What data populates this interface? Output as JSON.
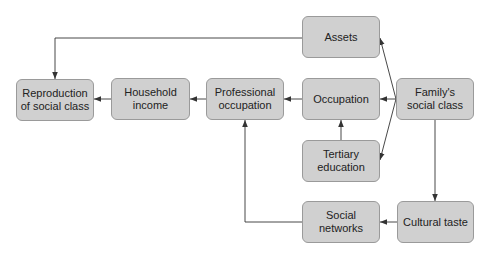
{
  "diagram": {
    "type": "flowchart",
    "colors": {
      "node_fill": "#d0d0d0",
      "node_border": "#9a9a9a",
      "text": "#222222",
      "edge": "#333333"
    },
    "nodes": {
      "reproduction": {
        "label": "Reproduction of social class",
        "x": 16,
        "y": 79,
        "w": 78,
        "h": 42
      },
      "household": {
        "label": "Household income",
        "x": 111,
        "y": 78,
        "w": 79,
        "h": 42
      },
      "professional": {
        "label": "Professional occupation",
        "x": 206,
        "y": 78,
        "w": 78,
        "h": 42
      },
      "assets": {
        "label": "Assets",
        "x": 302,
        "y": 16,
        "w": 78,
        "h": 42
      },
      "occupation": {
        "label": "Occupation",
        "x": 302,
        "y": 78,
        "w": 78,
        "h": 42
      },
      "tertiary": {
        "label": "Tertiary education",
        "x": 302,
        "y": 140,
        "w": 78,
        "h": 42
      },
      "social_networks": {
        "label": "Social networks",
        "x": 302,
        "y": 201,
        "w": 78,
        "h": 42
      },
      "family": {
        "label": "Family's social class",
        "x": 396,
        "y": 78,
        "w": 78,
        "h": 42
      },
      "cultural": {
        "label": "Cultural taste",
        "x": 397,
        "y": 201,
        "w": 77,
        "h": 42
      }
    },
    "edges": [
      {
        "from": "assets",
        "to": "reproduction",
        "points": [
          [
            302,
            38
          ],
          [
            55,
            38
          ],
          [
            55,
            79
          ]
        ]
      },
      {
        "from": "household",
        "to": "reproduction",
        "points": [
          [
            111,
            99
          ],
          [
            94,
            99
          ]
        ]
      },
      {
        "from": "professional",
        "to": "household",
        "points": [
          [
            206,
            99
          ],
          [
            190,
            99
          ]
        ]
      },
      {
        "from": "occupation",
        "to": "professional",
        "points": [
          [
            302,
            99
          ],
          [
            284,
            99
          ]
        ]
      },
      {
        "from": "family",
        "to": "occupation",
        "points": [
          [
            396,
            99
          ],
          [
            380,
            99
          ]
        ]
      },
      {
        "from": "family",
        "to": "assets",
        "points": [
          [
            396,
            99
          ],
          [
            380,
            38
          ]
        ]
      },
      {
        "from": "family",
        "to": "tertiary",
        "points": [
          [
            396,
            99
          ],
          [
            380,
            160
          ]
        ]
      },
      {
        "from": "tertiary",
        "to": "occupation",
        "points": [
          [
            341,
            140
          ],
          [
            341,
            120
          ]
        ]
      },
      {
        "from": "family",
        "to": "cultural",
        "points": [
          [
            435,
            120
          ],
          [
            435,
            201
          ]
        ]
      },
      {
        "from": "cultural",
        "to": "social_networks",
        "points": [
          [
            397,
            222
          ],
          [
            380,
            222
          ]
        ]
      },
      {
        "from": "social_networks",
        "to": "professional",
        "points": [
          [
            302,
            222
          ],
          [
            245,
            222
          ],
          [
            245,
            120
          ]
        ]
      }
    ]
  }
}
